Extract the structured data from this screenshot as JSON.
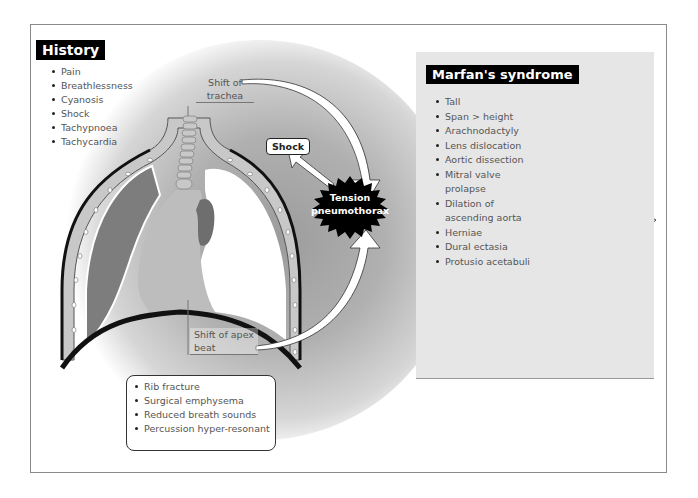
{
  "history": {
    "title": "History",
    "items": [
      "Pain",
      "Breathlessness",
      "Cyanosis",
      "Shock",
      "Tachypnoea",
      "Tachycardia"
    ]
  },
  "diagram": {
    "trachea_label": "Shift of trachea",
    "apex_label": "Shift of apex beat",
    "shock_label": "Shock",
    "central_label_line1": "Tension",
    "central_label_line2": "pneumothorax",
    "colors": {
      "chest_wall": "#c8c8c8",
      "collapsed_lung": "#7d7d7d",
      "pneumothorax_space": "#ffffff",
      "mediastinum": "#bdbdbd",
      "heart": "#6e6e6e",
      "burst": "#000000"
    }
  },
  "signs": {
    "items": [
      "Rib fracture",
      "Surgical emphysema",
      "Reduced breath sounds",
      "Percussion hyper-resonant"
    ]
  },
  "marfan": {
    "title": "Marfan's syndrome",
    "items": [
      "Tall",
      "Span > height",
      "Arachnodactyly",
      "Lens dislocation",
      "Aortic dissection",
      "Mitral valve prolapse",
      "Dilation of ascending aorta",
      "Herniae",
      "Dural ectasia",
      "Protusio acetabuli"
    ],
    "panel_color": "#e6e6e6"
  }
}
